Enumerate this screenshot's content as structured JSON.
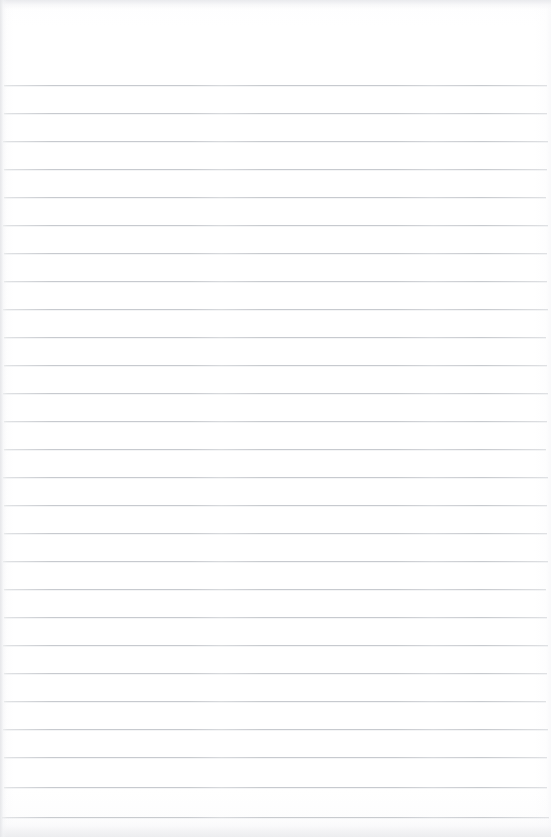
{
  "document": {
    "kind": "scanned-ruled-paper",
    "page_label": "",
    "content_text": "",
    "is_blank": "true"
  },
  "canvas": {
    "width": 551,
    "height": 837,
    "background_color": "#ffffff"
  },
  "ruling": {
    "line_color": "#c3c6cb",
    "line_thickness_px": 1,
    "line_count": 27,
    "first_line_y": 85,
    "line_spacing_px": 28,
    "line_left_x": 4,
    "line_right_x": 547,
    "top_margin_px": 85,
    "left_margin_px": 4,
    "right_margin_px": 4,
    "lines": [
      {
        "index": 1,
        "y": 85,
        "x1": 4,
        "x2": 547
      },
      {
        "index": 2,
        "y": 113,
        "x1": 4,
        "x2": 547
      },
      {
        "index": 3,
        "y": 141,
        "x1": 3,
        "x2": 548
      },
      {
        "index": 4,
        "y": 169,
        "x1": 4,
        "x2": 547
      },
      {
        "index": 5,
        "y": 197,
        "x1": 4,
        "x2": 546
      },
      {
        "index": 6,
        "y": 225,
        "x1": 3,
        "x2": 548
      },
      {
        "index": 7,
        "y": 253,
        "x1": 4,
        "x2": 547
      },
      {
        "index": 8,
        "y": 281,
        "x1": 4,
        "x2": 547
      },
      {
        "index": 9,
        "y": 309,
        "x1": 3,
        "x2": 548
      },
      {
        "index": 10,
        "y": 337,
        "x1": 4,
        "x2": 546
      },
      {
        "index": 11,
        "y": 365,
        "x1": 4,
        "x2": 547
      },
      {
        "index": 12,
        "y": 393,
        "x1": 3,
        "x2": 548
      },
      {
        "index": 13,
        "y": 421,
        "x1": 4,
        "x2": 547
      },
      {
        "index": 14,
        "y": 449,
        "x1": 4,
        "x2": 546
      },
      {
        "index": 15,
        "y": 477,
        "x1": 3,
        "x2": 548
      },
      {
        "index": 16,
        "y": 505,
        "x1": 4,
        "x2": 547
      },
      {
        "index": 17,
        "y": 533,
        "x1": 4,
        "x2": 547
      },
      {
        "index": 18,
        "y": 561,
        "x1": 3,
        "x2": 548
      },
      {
        "index": 19,
        "y": 589,
        "x1": 4,
        "x2": 546
      },
      {
        "index": 20,
        "y": 617,
        "x1": 4,
        "x2": 547
      },
      {
        "index": 21,
        "y": 645,
        "x1": 3,
        "x2": 548
      },
      {
        "index": 22,
        "y": 673,
        "x1": 4,
        "x2": 547
      },
      {
        "index": 23,
        "y": 701,
        "x1": 4,
        "x2": 546
      },
      {
        "index": 24,
        "y": 729,
        "x1": 3,
        "x2": 548
      },
      {
        "index": 25,
        "y": 757,
        "x1": 4,
        "x2": 547
      },
      {
        "index": 26,
        "y": 787,
        "x1": 4,
        "x2": 547
      },
      {
        "index": 27,
        "y": 817,
        "x1": 2,
        "x2": 549
      }
    ]
  },
  "scan_artifacts": {
    "top_band_color": "#e9eaed",
    "bottom_band_color": "#ecedef",
    "left_edge_color": "#e4e5e8",
    "paper_tint": "#fcfcfd"
  }
}
